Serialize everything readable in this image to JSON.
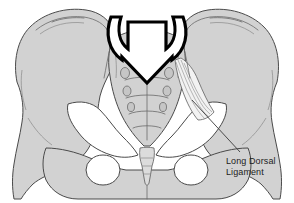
{
  "figure": {
    "background_color": "#ffffff",
    "bone_fill_color": "#d2d2d2",
    "outline_color": "#4a4a4a",
    "arrow_color": "#000000",
    "ligament_fill_color": "#f2f2f2",
    "label_color": "#1c1c1c"
  },
  "annotations": {
    "long_dorsal_ligament": {
      "line_1": "Long Dorsal",
      "line_2": "Ligament"
    }
  },
  "structures": {
    "left_ilium": "left-iliac-wing",
    "right_ilium": "right-iliac-wing",
    "sacrum": "sacrum",
    "coccyx": "coccyx",
    "left_obturator_foramen": "left-obturator-foramen",
    "right_obturator_foramen": "right-obturator-foramen",
    "pubic_symphysis": "pubic-symphysis",
    "force_arrow": "downward-force-arrow"
  }
}
